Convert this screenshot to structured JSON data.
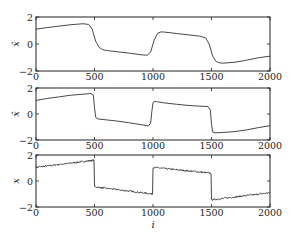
{
  "chart_data": [
    {
      "type": "line",
      "title": "",
      "xlabel": "",
      "ylabel": "x̂",
      "xlim": [
        0,
        2000
      ],
      "ylim": [
        -2,
        2
      ],
      "xticks": [
        0,
        500,
        1000,
        1500,
        2000
      ],
      "yticks": [
        -2,
        0,
        2
      ],
      "grid": false,
      "series": [
        {
          "name": "smooth estimate",
          "x": [
            0,
            100,
            200,
            300,
            400,
            450,
            480,
            510,
            540,
            570,
            600,
            700,
            800,
            900,
            950,
            980,
            1010,
            1040,
            1070,
            1100,
            1200,
            1300,
            1400,
            1450,
            1480,
            1510,
            1540,
            1570,
            1600,
            1700,
            1800,
            1900,
            2000
          ],
          "y": [
            1.1,
            1.22,
            1.33,
            1.43,
            1.5,
            1.45,
            1.1,
            0.2,
            -0.25,
            -0.42,
            -0.48,
            -0.58,
            -0.68,
            -0.8,
            -0.83,
            -0.6,
            0.3,
            0.8,
            0.9,
            0.88,
            0.78,
            0.68,
            0.58,
            0.45,
            0.0,
            -0.9,
            -1.3,
            -1.4,
            -1.42,
            -1.35,
            -1.2,
            -1.02,
            -0.9
          ]
        }
      ]
    },
    {
      "type": "line",
      "title": "",
      "xlabel": "",
      "ylabel": "x̂",
      "xlim": [
        0,
        2000
      ],
      "ylim": [
        -2,
        2
      ],
      "xticks": [
        0,
        500,
        1000,
        1500,
        2000
      ],
      "yticks": [
        -2,
        0,
        2
      ],
      "grid": false,
      "series": [
        {
          "name": "sharper estimate",
          "x": [
            0,
            100,
            200,
            300,
            400,
            470,
            490,
            500,
            510,
            530,
            600,
            700,
            800,
            900,
            960,
            980,
            990,
            1000,
            1010,
            1030,
            1100,
            1200,
            1300,
            1400,
            1470,
            1490,
            1500,
            1510,
            1530,
            1600,
            1700,
            1800,
            1900,
            2000
          ],
          "y": [
            1.05,
            1.2,
            1.32,
            1.45,
            1.52,
            1.58,
            1.45,
            0.5,
            -0.25,
            -0.38,
            -0.45,
            -0.55,
            -0.68,
            -0.82,
            -0.92,
            -0.7,
            0.2,
            0.85,
            0.97,
            0.95,
            0.85,
            0.75,
            0.66,
            0.6,
            0.58,
            0.3,
            -0.8,
            -1.38,
            -1.45,
            -1.42,
            -1.35,
            -1.22,
            -1.05,
            -0.9
          ]
        }
      ]
    },
    {
      "type": "line",
      "title": "",
      "xlabel": "i",
      "ylabel": "x",
      "xlim": [
        0,
        2000
      ],
      "ylim": [
        -2,
        2
      ],
      "xticks": [
        0,
        500,
        1000,
        1500,
        2000
      ],
      "yticks": [
        -2,
        0,
        2
      ],
      "grid": false,
      "series": [
        {
          "name": "noisy signal (piecewise linear with jumps)",
          "x": [
            0,
            499,
            500,
            999,
            1000,
            1499,
            1500,
            2000
          ],
          "y": [
            1.05,
            1.6,
            -0.45,
            -1.0,
            1.05,
            0.6,
            -1.45,
            -0.9
          ],
          "noise": "small high-frequency noise (~±0.05)"
        }
      ]
    }
  ],
  "panels": [
    {
      "ylabel": "x̂",
      "yticks": [
        "2",
        "0",
        "−2"
      ],
      "xticks": [
        "0",
        "500",
        "1000",
        "1500",
        "2000"
      ]
    },
    {
      "ylabel": "x̂",
      "yticks": [
        "2",
        "0",
        "−2"
      ],
      "xticks": [
        "0",
        "500",
        "1000",
        "1500",
        "2000"
      ]
    },
    {
      "ylabel": "x",
      "yticks": [
        "2",
        "0",
        "−2"
      ],
      "xticks": [
        "0",
        "500",
        "1000",
        "1500",
        "2000"
      ]
    }
  ],
  "xlabel": "i",
  "colors": {
    "line": "#333333",
    "axes": "#222222"
  }
}
